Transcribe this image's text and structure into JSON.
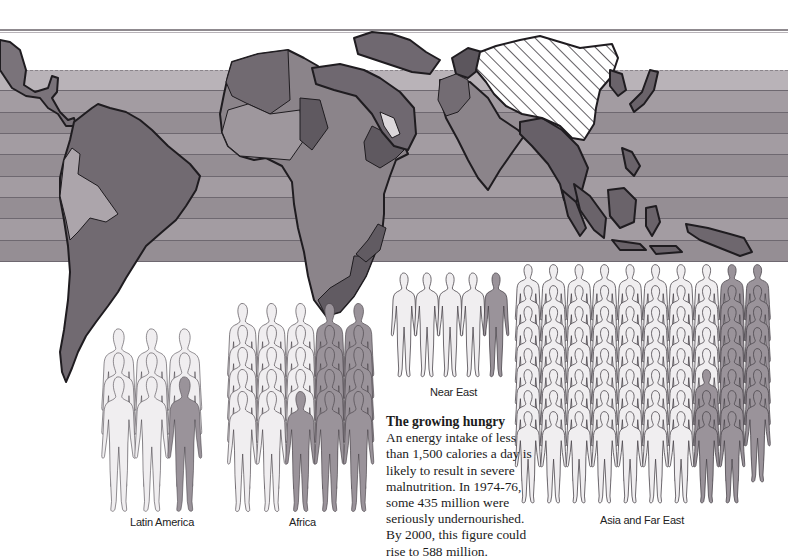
{
  "caption": {
    "title": "The growing hungry",
    "lines": [
      "An energy intake of less",
      "than 1,500 calories a day is",
      "likely to result in severe",
      "malnutrition. In 1974-76,",
      "some 435 million were",
      "seriously undernourished.",
      "By 2000, this figure could",
      "rise to 588 million."
    ]
  },
  "colors": {
    "band_light": "#b9b3b8",
    "band_mid": "#a39ca2",
    "band_dark": "#958e94",
    "land_dark": "#6f6870",
    "land_mid": "#8d868c",
    "land_light": "#aba4aa",
    "outline": "#1f1c20",
    "figure_light": "#f0eef0",
    "figure_shaded": "#9a939a",
    "figure_outline": "#4a454b"
  },
  "map": {
    "bands": 9,
    "hatched_region": "China (no data)"
  },
  "chart_data": {
    "type": "pictogram",
    "title": "The growing hungry",
    "note": "Each figure represents a share of the region's population; shaded figures represent the seriously undernourished.",
    "groups": [
      {
        "label": "Latin America",
        "columns": 3,
        "rows": 3,
        "total": 9,
        "shaded": 1
      },
      {
        "label": "Africa",
        "columns": 5,
        "rows": 5,
        "total": 25,
        "shaded": 11
      },
      {
        "label": "Near East",
        "columns": 5,
        "rows": 1,
        "total": 5,
        "shaded": 1
      },
      {
        "label": "Asia and Far East",
        "columns": 10,
        "rows": 8,
        "total": 79,
        "shaded": 19
      }
    ],
    "annotations": [
      "1974-76: some 435 million seriously undernourished",
      "2000 projection: 588 million",
      "Threshold: 1,500 calories a day"
    ]
  },
  "groups": {
    "latin_america": {
      "label": "Latin America"
    },
    "africa": {
      "label": "Africa"
    },
    "near_east": {
      "label": "Near East"
    },
    "asia": {
      "label": "Asia and Far East"
    }
  }
}
